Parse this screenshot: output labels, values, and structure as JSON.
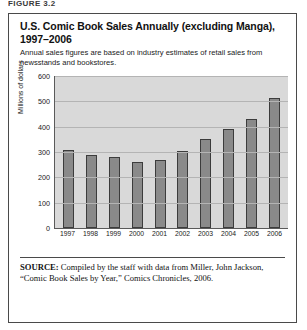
{
  "figure": {
    "label": "FIGURE 3.2"
  },
  "title": "U.S. Comic Book Sales Annually (excluding Manga), 1997–2006",
  "subtitle": "Annual sales figures are based on industry estimates of retail sales from newsstands and bookstores.",
  "source": {
    "prefix": "SOURCE:",
    "text": " Compiled by the staff with data from Miller, John Jackson, “Comic Book Sales by Year,” Comics Chronicles, 2006."
  },
  "colors": {
    "bar_fill": "#8a8a8a",
    "bar_border": "#3c3c3c",
    "plot_background": "#d9d9d9",
    "gridline": "#b4b4b4",
    "frame": "#4a4a4a"
  },
  "chart_data": {
    "type": "bar",
    "title": "U.S. Comic Book Sales Annually (excluding Manga), 1997–2006",
    "xlabel": "",
    "ylabel": "Millions of dollars",
    "categories": [
      "1997",
      "1998",
      "1999",
      "2000",
      "2001",
      "2002",
      "2003",
      "2004",
      "2005",
      "2006"
    ],
    "values": [
      310,
      288,
      280,
      262,
      268,
      305,
      350,
      390,
      430,
      512
    ],
    "ylim": [
      0,
      600
    ],
    "yticks": [
      600,
      500,
      400,
      300,
      200,
      100,
      0
    ],
    "ytick_labels": [
      "600",
      "500",
      "400",
      "300",
      "200",
      "100",
      "0"
    ],
    "grid": true,
    "legend": false,
    "series": [
      {
        "name": "U.S. Comic Book Sales",
        "values": [
          310,
          288,
          280,
          262,
          268,
          305,
          350,
          390,
          430,
          512
        ]
      }
    ]
  }
}
